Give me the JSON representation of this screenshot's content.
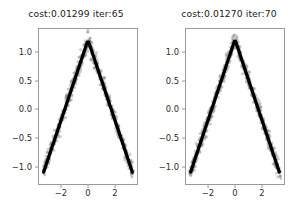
{
  "figure": {
    "background": "#ffffff",
    "panel_count": 2
  },
  "chart_data": [
    {
      "type": "scatter",
      "title": "cost:0.01299  iter:65",
      "cost": 0.01299,
      "iter": 65,
      "xlabel": "",
      "ylabel": "",
      "xlim": [
        -3.7,
        3.7
      ],
      "ylim": [
        -1.32,
        1.42
      ],
      "xticks": [
        -2,
        0,
        2
      ],
      "xticklabels": [
        "−2",
        "0",
        "2"
      ],
      "yticks": [
        1.0,
        0.5,
        0.0,
        -0.5,
        -1.0
      ],
      "yticklabels": [
        "1.0",
        "0.5",
        "0.0",
        "−0.5",
        "−1.0"
      ],
      "grid": false,
      "legend": null,
      "scatter_color": "#808080",
      "line_color": "#000000",
      "series": [
        {
          "name": "data",
          "kind": "scatter",
          "color": "#808080",
          "x": [
            -3.35,
            -3.25,
            -3.15,
            -3.05,
            -2.95,
            -2.85,
            -2.75,
            -2.65,
            -2.55,
            -2.45,
            -2.35,
            -2.25,
            -2.15,
            -2.05,
            -1.95,
            -1.85,
            -1.75,
            -1.65,
            -1.55,
            -1.45,
            -1.35,
            -1.25,
            -1.15,
            -1.05,
            -0.95,
            -0.85,
            -0.75,
            -0.65,
            -0.55,
            -0.45,
            -0.35,
            -0.25,
            -0.15,
            -0.05,
            0.05,
            0.15,
            0.25,
            0.35,
            0.45,
            0.55,
            0.65,
            0.75,
            0.85,
            0.95,
            1.05,
            1.15,
            1.25,
            1.35,
            1.45,
            1.55,
            1.65,
            1.75,
            1.85,
            1.95,
            2.05,
            2.15,
            2.25,
            2.35,
            2.45,
            2.55,
            2.65,
            2.75,
            2.85,
            2.95,
            3.05,
            3.15,
            3.25,
            3.35
          ],
          "y": [
            -1.11,
            -1.04,
            -0.97,
            -0.9,
            -0.83,
            -0.76,
            -0.69,
            -0.62,
            -0.55,
            -0.48,
            -0.41,
            -0.34,
            -0.27,
            -0.2,
            -0.13,
            -0.06,
            0.01,
            0.08,
            0.15,
            0.22,
            0.29,
            0.36,
            0.43,
            0.5,
            0.57,
            0.64,
            0.71,
            0.78,
            0.85,
            0.92,
            0.99,
            1.06,
            1.13,
            1.19,
            1.19,
            1.13,
            1.06,
            0.99,
            0.92,
            0.85,
            0.78,
            0.71,
            0.64,
            0.57,
            0.5,
            0.43,
            0.36,
            0.29,
            0.22,
            0.15,
            0.08,
            0.01,
            -0.06,
            -0.13,
            -0.2,
            -0.27,
            -0.34,
            -0.41,
            -0.48,
            -0.55,
            -0.62,
            -0.69,
            -0.76,
            -0.83,
            -0.9,
            -0.97,
            -1.04,
            -1.11
          ],
          "noise_std": 0.075
        },
        {
          "name": "fit",
          "kind": "line",
          "color": "#000000",
          "linewidth": 3.2,
          "x": [
            -3.35,
            -0.05,
            0.05,
            3.35
          ],
          "y": [
            -1.11,
            1.19,
            1.19,
            -1.11
          ]
        }
      ]
    },
    {
      "type": "scatter",
      "title": "cost:0.01270  iter:70",
      "cost": 0.0127,
      "iter": 70,
      "xlabel": "",
      "ylabel": "",
      "xlim": [
        -3.7,
        3.7
      ],
      "ylim": [
        -1.32,
        1.42
      ],
      "xticks": [
        -2,
        0,
        2
      ],
      "xticklabels": [
        "−2",
        "0",
        "2"
      ],
      "yticks": [
        1.0,
        0.5,
        0.0,
        -0.5,
        -1.0
      ],
      "yticklabels": [
        "1.0",
        "0.5",
        "0.0",
        "−0.5",
        "−1.0"
      ],
      "grid": false,
      "legend": null,
      "scatter_color": "#808080",
      "line_color": "#000000",
      "series": [
        {
          "name": "data",
          "kind": "scatter",
          "color": "#808080",
          "x": [
            -3.35,
            -3.25,
            -3.15,
            -3.05,
            -2.95,
            -2.85,
            -2.75,
            -2.65,
            -2.55,
            -2.45,
            -2.35,
            -2.25,
            -2.15,
            -2.05,
            -1.95,
            -1.85,
            -1.75,
            -1.65,
            -1.55,
            -1.45,
            -1.35,
            -1.25,
            -1.15,
            -1.05,
            -0.95,
            -0.85,
            -0.75,
            -0.65,
            -0.55,
            -0.45,
            -0.35,
            -0.25,
            -0.15,
            -0.05,
            0.05,
            0.15,
            0.25,
            0.35,
            0.45,
            0.55,
            0.65,
            0.75,
            0.85,
            0.95,
            1.05,
            1.15,
            1.25,
            1.35,
            1.45,
            1.55,
            1.65,
            1.75,
            1.85,
            1.95,
            2.05,
            2.15,
            2.25,
            2.35,
            2.45,
            2.55,
            2.65,
            2.75,
            2.85,
            2.95,
            3.05,
            3.15,
            3.25,
            3.35
          ],
          "y": [
            -1.11,
            -1.04,
            -0.97,
            -0.9,
            -0.83,
            -0.76,
            -0.69,
            -0.62,
            -0.55,
            -0.48,
            -0.41,
            -0.34,
            -0.27,
            -0.2,
            -0.13,
            -0.06,
            0.01,
            0.08,
            0.15,
            0.22,
            0.29,
            0.36,
            0.43,
            0.5,
            0.57,
            0.64,
            0.71,
            0.78,
            0.85,
            0.92,
            0.99,
            1.06,
            1.13,
            1.2,
            1.2,
            1.13,
            1.06,
            0.99,
            0.92,
            0.85,
            0.78,
            0.71,
            0.64,
            0.57,
            0.5,
            0.43,
            0.36,
            0.29,
            0.22,
            0.15,
            0.08,
            0.01,
            -0.06,
            -0.13,
            -0.2,
            -0.27,
            -0.34,
            -0.41,
            -0.48,
            -0.55,
            -0.62,
            -0.69,
            -0.76,
            -0.83,
            -0.9,
            -0.97,
            -1.04,
            -1.11
          ],
          "noise_std": 0.072
        },
        {
          "name": "fit",
          "kind": "line",
          "color": "#000000",
          "linewidth": 3.2,
          "x": [
            -3.35,
            -0.05,
            0.05,
            3.35
          ],
          "y": [
            -1.11,
            1.2,
            1.2,
            -1.11
          ]
        }
      ]
    }
  ]
}
